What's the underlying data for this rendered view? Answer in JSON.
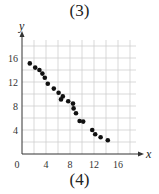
{
  "top_label": "(3)",
  "bottom_label": "(4)",
  "chart_data": {
    "type": "scatter",
    "title": "(3)",
    "caption": "(4)",
    "xlabel": "x",
    "ylabel": "y",
    "xlim": [
      0,
      19
    ],
    "ylim": [
      0,
      19
    ],
    "xticks": [
      0,
      4,
      8,
      12,
      16
    ],
    "yticks": [
      4,
      8,
      12,
      16
    ],
    "grid": true,
    "grid_step": 2,
    "legend": null,
    "x": [
      1.3,
      2.2,
      2.9,
      3.4,
      3.8,
      4.3,
      5.3,
      6.1,
      6.8,
      6.5,
      7.7,
      8.5,
      8.6,
      9.0,
      9.6,
      10.2,
      11.7,
      12.2,
      13.1,
      14.3
    ],
    "y": [
      15.1,
      14.4,
      14.0,
      13.4,
      12.7,
      11.7,
      10.9,
      10.2,
      9.6,
      9.1,
      8.8,
      8.4,
      7.6,
      6.8,
      5.5,
      5.4,
      4.0,
      3.3,
      2.8,
      2.3
    ]
  },
  "colors": {
    "grid": "#cfcfcf",
    "axis": "#333333",
    "point": "#111111"
  }
}
